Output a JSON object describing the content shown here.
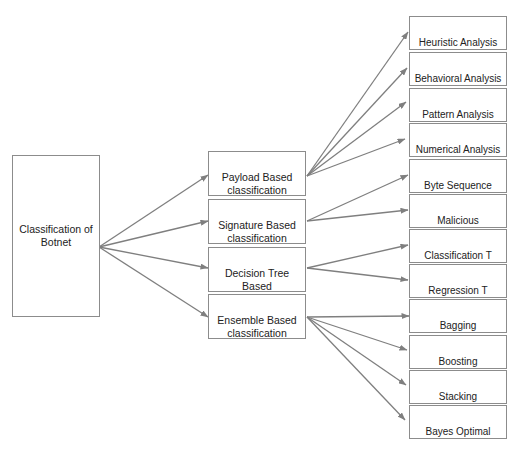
{
  "diagram": {
    "title": "Classification of Botnet",
    "colors": {
      "border": "#8c8c8c",
      "arrow": "#7f7f7f",
      "text": "#222222",
      "background": "#ffffff"
    },
    "root": {
      "label": "Classification of\nBotnet",
      "box": [
        12,
        155,
        88,
        162
      ],
      "anchor": [
        99,
        247
      ]
    },
    "categories": [
      {
        "label": "Payload Based\nclassification",
        "box": [
          208,
          151,
          98,
          45
        ],
        "anchor_in": [
          208,
          175
        ],
        "anchor_out": [
          307,
          176
        ],
        "children": [
          0,
          1,
          2,
          3
        ]
      },
      {
        "label": "Signature Based\nclassification",
        "box": [
          208,
          199,
          98,
          45
        ],
        "anchor_in": [
          208,
          221
        ],
        "anchor_out": [
          307,
          221
        ],
        "children": [
          4,
          5
        ]
      },
      {
        "label": "Decision Tree Based\nclassification",
        "box": [
          208,
          247,
          98,
          45
        ],
        "anchor_in": [
          208,
          268
        ],
        "anchor_out": [
          307,
          268
        ],
        "children": [
          6,
          7
        ]
      },
      {
        "label": "Ensemble Based\nclassification",
        "box": [
          208,
          294,
          98,
          45
        ],
        "anchor_in": [
          208,
          317
        ],
        "anchor_out": [
          307,
          317
        ],
        "children": [
          8,
          9,
          10,
          11
        ]
      }
    ],
    "methods": [
      {
        "label": "Heuristic Analysis",
        "box": [
          409,
          16,
          98,
          34
        ],
        "anchor": [
          408,
          32
        ]
      },
      {
        "label": "Behavioral Analysis",
        "box": [
          409,
          52,
          98,
          34
        ],
        "anchor": [
          407,
          68
        ]
      },
      {
        "label": "Pattern Analysis",
        "box": [
          409,
          88,
          98,
          34
        ],
        "anchor": [
          406,
          102
        ]
      },
      {
        "label": "Numerical Analysis",
        "box": [
          409,
          123,
          98,
          34
        ],
        "anchor": [
          405,
          139
        ]
      },
      {
        "label": "Byte Sequence",
        "box": [
          409,
          159,
          98,
          34
        ],
        "anchor": [
          408,
          175
        ]
      },
      {
        "label": "Malicious\nInstruction",
        "box": [
          409,
          194,
          98,
          34
        ],
        "anchor": [
          408,
          210
        ]
      },
      {
        "label": "Classification T\nAnalysis",
        "box": [
          409,
          229,
          98,
          34
        ],
        "anchor": [
          408,
          245
        ]
      },
      {
        "label": "Regression T\nAnalysis",
        "box": [
          409,
          264,
          98,
          34
        ],
        "anchor": [
          408,
          280
        ]
      },
      {
        "label": "Bagging",
        "box": [
          409,
          299,
          98,
          34
        ],
        "anchor": [
          409,
          316
        ]
      },
      {
        "label": "Boosting",
        "box": [
          409,
          335,
          98,
          34
        ],
        "anchor": [
          407,
          350
        ]
      },
      {
        "label": "Stacking",
        "box": [
          409,
          370,
          98,
          34
        ],
        "anchor": [
          406,
          385
        ]
      },
      {
        "label": "Bayes Optimal",
        "box": [
          409,
          405,
          98,
          34
        ],
        "anchor": [
          405,
          420
        ]
      }
    ]
  }
}
